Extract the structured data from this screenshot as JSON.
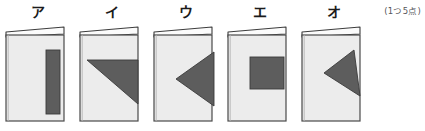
{
  "page": {
    "score_note": "(1つ5点)",
    "background_color": "#ffffff"
  },
  "palette": {
    "paper_fill": "#ececec",
    "paper_stroke": "#4a4a4a",
    "flap_fill": "#fbfbfb",
    "flap_stroke": "#3d3d3d",
    "shaded_fill": "#5d5d5d",
    "shaded_stroke": "#3a3a3a",
    "label_color": "#1b1b1b",
    "note_color": "#55555a"
  },
  "figures": [
    {
      "label": "ア",
      "shape_name": "vertical-rectangle-right-edge",
      "description": "縦長の長方形が右端に寄っている"
    },
    {
      "label": "イ",
      "shape_name": "triangle-pointing-lower-left",
      "description": "左下を向いた直角三角形"
    },
    {
      "label": "ウ",
      "shape_name": "triangle-pointing-left",
      "description": "左を向いた三角形が右端に接する"
    },
    {
      "label": "エ",
      "shape_name": "square-center-right",
      "description": "中央やや右寄りの正方形"
    },
    {
      "label": "オ",
      "shape_name": "tilted-triangle-pointing-left",
      "description": "傾いた三角形が左を向く"
    }
  ]
}
